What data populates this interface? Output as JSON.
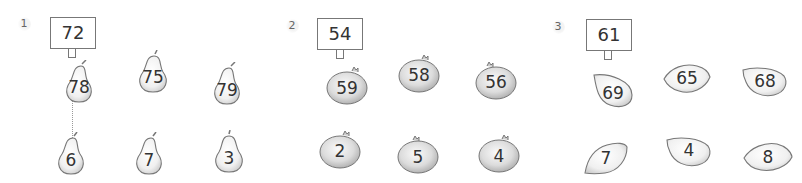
{
  "problems": [
    {
      "label": "1",
      "target": "72",
      "fruit": "pear",
      "top_row": [
        "78",
        "75",
        "79"
      ],
      "bottom_row": [
        "6",
        "7",
        "3"
      ]
    },
    {
      "label": "2",
      "target": "54",
      "fruit": "pomegranate",
      "top_row": [
        "59",
        "58",
        "56"
      ],
      "bottom_row": [
        "2",
        "5",
        "4"
      ]
    },
    {
      "label": "3",
      "target": "61",
      "fruit": "lemon",
      "top_row": [
        "69",
        "65",
        "68"
      ],
      "bottom_row": [
        "7",
        "4",
        "8"
      ]
    }
  ],
  "icons": {
    "pear": "pear-icon",
    "pomegranate": "pomegranate-icon",
    "lemon": "lemon-icon"
  }
}
